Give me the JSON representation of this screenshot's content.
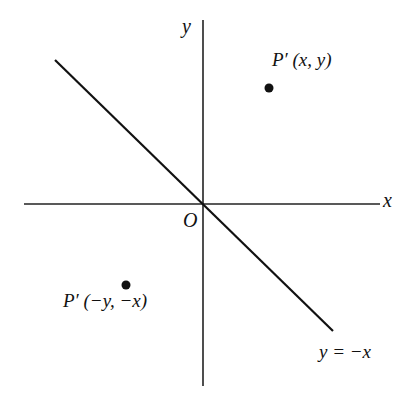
{
  "diagram": {
    "axes": {
      "x_label": "x",
      "y_label": "y",
      "origin_label": "O"
    },
    "line": {
      "label": "y = −x"
    },
    "points": [
      {
        "name": "P'",
        "coords": "(x, y)",
        "label": "P′ (x, y)"
      },
      {
        "name": "P'",
        "coords": "(−y, −x)",
        "label": "P′ (−y, −x)"
      }
    ],
    "colors": {
      "ink": "#111111",
      "background": "#ffffff"
    }
  }
}
